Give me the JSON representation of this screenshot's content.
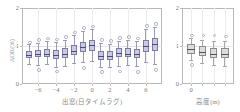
{
  "figure": {
    "background": "#ffffff",
    "accent_box_fill": "#c9c9e4",
    "accent_box_edge": "#7b7ba6",
    "gray_box_fill": "#dcdcdc",
    "gray_box_edge": "#8c8c8c"
  },
  "chart_data": [
    {
      "type": "box",
      "panel": "left",
      "title": "",
      "xlabel": "出窓(日タイムラグ)",
      "ylabel": "ΔOR(%)",
      "ylim": [
        0,
        2
      ],
      "yticks": [
        0,
        1,
        2
      ],
      "ytick_labels": [
        "0",
        "1",
        "2"
      ],
      "xlim": [
        -7.8,
        7.8
      ],
      "xticks": [
        -6,
        -4,
        -2,
        0,
        2,
        4,
        6
      ],
      "xtick_labels": [
        "−6",
        "−4",
        "−2",
        "0",
        "2",
        "4",
        "6"
      ],
      "grid": true,
      "reference_line": 1,
      "categories": [
        -7,
        -6,
        -5,
        -4,
        -3,
        -2,
        -1,
        0,
        1,
        2,
        3,
        4,
        5,
        6,
        7
      ],
      "boxes": [
        {
          "x": -7,
          "min": 0.52,
          "q1": 0.68,
          "median": 0.76,
          "q3": 0.88,
          "max": 1.04,
          "outliers": [
            1.12
          ]
        },
        {
          "x": -6,
          "min": 0.5,
          "q1": 0.7,
          "median": 0.8,
          "q3": 0.9,
          "max": 1.08,
          "outliers": [
            0.4,
            1.18
          ]
        },
        {
          "x": -5,
          "min": 0.52,
          "q1": 0.7,
          "median": 0.79,
          "q3": 0.92,
          "max": 1.14,
          "outliers": [
            1.22
          ]
        },
        {
          "x": -4,
          "min": 0.46,
          "q1": 0.66,
          "median": 0.76,
          "q3": 0.9,
          "max": 1.1,
          "outliers": [
            0.36,
            1.2
          ]
        },
        {
          "x": -3,
          "min": 0.48,
          "q1": 0.68,
          "median": 0.78,
          "q3": 0.94,
          "max": 1.16,
          "outliers": [
            1.26
          ]
        },
        {
          "x": -2,
          "min": 0.56,
          "q1": 0.76,
          "median": 0.88,
          "q3": 1.02,
          "max": 1.28,
          "outliers": [
            1.38
          ]
        },
        {
          "x": -1,
          "min": 0.58,
          "q1": 0.84,
          "median": 0.98,
          "q3": 1.1,
          "max": 1.4,
          "outliers": [
            0.44,
            1.5
          ]
        },
        {
          "x": 0,
          "min": 0.6,
          "q1": 0.88,
          "median": 1.02,
          "q3": 1.16,
          "max": 1.44,
          "outliers": [
            1.54
          ]
        },
        {
          "x": 1,
          "min": 0.46,
          "q1": 0.64,
          "median": 0.74,
          "q3": 0.88,
          "max": 1.08,
          "outliers": [
            0.34,
            1.18
          ]
        },
        {
          "x": 2,
          "min": 0.44,
          "q1": 0.62,
          "median": 0.73,
          "q3": 0.86,
          "max": 1.06,
          "outliers": [
            1.16
          ]
        },
        {
          "x": 3,
          "min": 0.48,
          "q1": 0.7,
          "median": 0.82,
          "q3": 0.94,
          "max": 1.14,
          "outliers": [
            0.36,
            1.24
          ]
        },
        {
          "x": 4,
          "min": 0.5,
          "q1": 0.7,
          "median": 0.8,
          "q3": 0.94,
          "max": 1.16,
          "outliers": [
            1.26
          ]
        },
        {
          "x": 5,
          "min": 0.48,
          "q1": 0.68,
          "median": 0.8,
          "q3": 0.92,
          "max": 1.12,
          "outliers": [
            0.34,
            1.22
          ]
        },
        {
          "x": 6,
          "min": 0.58,
          "q1": 0.84,
          "median": 1.0,
          "q3": 1.16,
          "max": 1.44,
          "outliers": [
            1.56
          ]
        },
        {
          "x": 7,
          "min": 0.52,
          "q1": 0.86,
          "median": 1.04,
          "q3": 1.22,
          "max": 1.5,
          "outliers": [
            0.4,
            1.6
          ]
        }
      ]
    },
    {
      "type": "box",
      "panel": "right",
      "title": "",
      "xlabel": "高度(m)",
      "ylabel": "",
      "ylim": [
        0,
        2
      ],
      "yticks": [
        0,
        1,
        2
      ],
      "ytick_labels": [
        "0",
        "1",
        "2"
      ],
      "xlim": [
        -0.8,
        3.8
      ],
      "xticks": [
        0,
        1,
        2,
        3
      ],
      "xtick_labels": [
        "0",
        "",
        "",
        ""
      ],
      "grid": true,
      "reference_line": 1,
      "categories": [
        0,
        1,
        2,
        3
      ],
      "boxes": [
        {
          "x": 0,
          "min": 0.62,
          "q1": 0.8,
          "median": 0.92,
          "q3": 1.04,
          "max": 1.2,
          "outliers": [
            0.52,
            1.3
          ]
        },
        {
          "x": 1,
          "min": 0.56,
          "q1": 0.74,
          "median": 0.84,
          "q3": 1.0,
          "max": 1.16,
          "outliers": [
            1.3
          ]
        },
        {
          "x": 2,
          "min": 0.5,
          "q1": 0.68,
          "median": 0.78,
          "q3": 0.96,
          "max": 1.14,
          "outliers": [
            1.3
          ]
        },
        {
          "x": 3,
          "min": 0.48,
          "q1": 0.68,
          "median": 0.8,
          "q3": 0.96,
          "max": 1.12,
          "outliers": [
            1.28
          ]
        }
      ]
    }
  ]
}
